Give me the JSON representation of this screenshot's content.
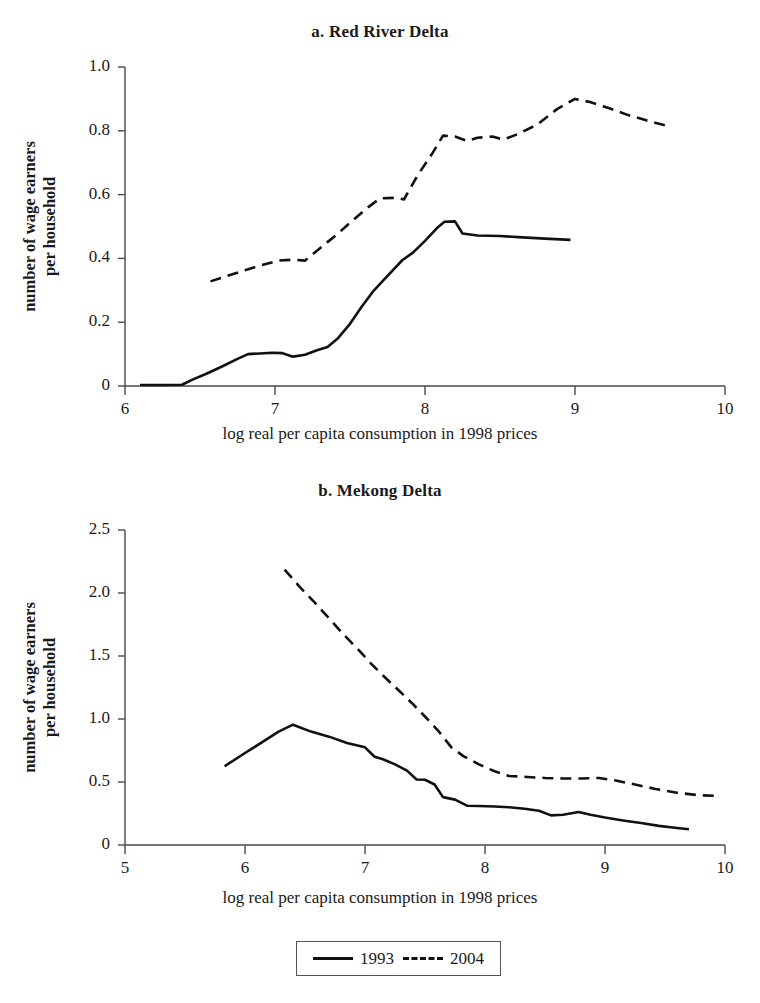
{
  "figure": {
    "legend": {
      "entries": [
        {
          "label": "1993",
          "style": "solid"
        },
        {
          "label": "2004",
          "style": "dashed"
        }
      ]
    }
  },
  "chart_data": [
    {
      "id": "panel-a",
      "type": "line",
      "title": "a. Red River Delta",
      "xlabel": "log real per capita consumption in 1998 prices",
      "ylabel": "number of wage earners\nper household",
      "ylabel_line1": "number of wage earners",
      "ylabel_line2": "per household",
      "xlim": [
        6,
        10
      ],
      "ylim": [
        0,
        1.0
      ],
      "xticks": [
        6,
        7,
        8,
        9,
        10
      ],
      "xtick_labels": [
        "6",
        "7",
        "8",
        "9",
        "10"
      ],
      "yticks": [
        0,
        0.2,
        0.4,
        0.6,
        0.8,
        1.0
      ],
      "ytick_labels": [
        "0",
        "0.2",
        "0.4",
        "0.6",
        "0.8",
        "1.0"
      ],
      "grid": false,
      "legend_position": "below-figure",
      "series": [
        {
          "name": "1993",
          "style": "solid",
          "color": "#111111",
          "points": [
            [
              6.1,
              0.003
            ],
            [
              6.2,
              0.003
            ],
            [
              6.3,
              0.003
            ],
            [
              6.38,
              0.004
            ],
            [
              6.45,
              0.02
            ],
            [
              6.55,
              0.04
            ],
            [
              6.65,
              0.062
            ],
            [
              6.75,
              0.085
            ],
            [
              6.82,
              0.1
            ],
            [
              6.9,
              0.102
            ],
            [
              6.98,
              0.104
            ],
            [
              7.05,
              0.103
            ],
            [
              7.12,
              0.092
            ],
            [
              7.2,
              0.098
            ],
            [
              7.28,
              0.112
            ],
            [
              7.35,
              0.122
            ],
            [
              7.42,
              0.15
            ],
            [
              7.5,
              0.195
            ],
            [
              7.58,
              0.25
            ],
            [
              7.66,
              0.3
            ],
            [
              7.75,
              0.345
            ],
            [
              7.85,
              0.395
            ],
            [
              7.92,
              0.418
            ],
            [
              8.0,
              0.455
            ],
            [
              8.08,
              0.495
            ],
            [
              8.13,
              0.515
            ],
            [
              8.2,
              0.516
            ],
            [
              8.25,
              0.478
            ],
            [
              8.35,
              0.472
            ],
            [
              8.5,
              0.47
            ],
            [
              8.65,
              0.466
            ],
            [
              8.8,
              0.462
            ],
            [
              8.97,
              0.458
            ]
          ]
        },
        {
          "name": "2004",
          "style": "dashed",
          "color": "#111111",
          "points": [
            [
              6.57,
              0.328
            ],
            [
              6.7,
              0.348
            ],
            [
              6.8,
              0.363
            ],
            [
              6.92,
              0.38
            ],
            [
              7.02,
              0.393
            ],
            [
              7.12,
              0.396
            ],
            [
              7.2,
              0.393
            ],
            [
              7.3,
              0.432
            ],
            [
              7.42,
              0.478
            ],
            [
              7.52,
              0.52
            ],
            [
              7.62,
              0.56
            ],
            [
              7.7,
              0.588
            ],
            [
              7.8,
              0.59
            ],
            [
              7.86,
              0.585
            ],
            [
              7.95,
              0.66
            ],
            [
              8.05,
              0.73
            ],
            [
              8.12,
              0.785
            ],
            [
              8.2,
              0.782
            ],
            [
              8.28,
              0.768
            ],
            [
              8.35,
              0.778
            ],
            [
              8.45,
              0.782
            ],
            [
              8.52,
              0.772
            ],
            [
              8.62,
              0.79
            ],
            [
              8.75,
              0.82
            ],
            [
              8.88,
              0.868
            ],
            [
              9.0,
              0.9
            ],
            [
              9.1,
              0.89
            ],
            [
              9.22,
              0.872
            ],
            [
              9.35,
              0.85
            ],
            [
              9.48,
              0.832
            ],
            [
              9.62,
              0.815
            ]
          ]
        }
      ]
    },
    {
      "id": "panel-b",
      "type": "line",
      "title": "b. Mekong Delta",
      "xlabel": "log real per capita consumption in 1998 prices",
      "ylabel": "number of wage earners\nper household",
      "ylabel_line1": "number of wage earners",
      "ylabel_line2": "per household",
      "xlim": [
        5,
        10
      ],
      "ylim": [
        0,
        2.5
      ],
      "xticks": [
        5,
        6,
        7,
        8,
        9,
        10
      ],
      "xtick_labels": [
        "5",
        "6",
        "7",
        "8",
        "9",
        "10"
      ],
      "yticks": [
        0,
        0.5,
        1.0,
        1.5,
        2.0,
        2.5
      ],
      "ytick_labels": [
        "0",
        "0.5",
        "1.0",
        "1.5",
        "2.0",
        "2.5"
      ],
      "grid": false,
      "legend_position": "below-figure",
      "series": [
        {
          "name": "1993",
          "style": "solid",
          "color": "#111111",
          "points": [
            [
              5.83,
              0.625
            ],
            [
              6.0,
              0.73
            ],
            [
              6.15,
              0.82
            ],
            [
              6.28,
              0.9
            ],
            [
              6.4,
              0.955
            ],
            [
              6.55,
              0.9
            ],
            [
              6.7,
              0.86
            ],
            [
              6.85,
              0.81
            ],
            [
              7.0,
              0.775
            ],
            [
              7.08,
              0.7
            ],
            [
              7.15,
              0.68
            ],
            [
              7.25,
              0.64
            ],
            [
              7.35,
              0.59
            ],
            [
              7.43,
              0.52
            ],
            [
              7.5,
              0.518
            ],
            [
              7.58,
              0.48
            ],
            [
              7.65,
              0.38
            ],
            [
              7.75,
              0.36
            ],
            [
              7.85,
              0.312
            ],
            [
              7.95,
              0.31
            ],
            [
              8.08,
              0.305
            ],
            [
              8.2,
              0.3
            ],
            [
              8.33,
              0.288
            ],
            [
              8.45,
              0.272
            ],
            [
              8.55,
              0.235
            ],
            [
              8.65,
              0.24
            ],
            [
              8.78,
              0.262
            ],
            [
              8.88,
              0.24
            ],
            [
              9.0,
              0.218
            ],
            [
              9.15,
              0.195
            ],
            [
              9.3,
              0.175
            ],
            [
              9.45,
              0.152
            ],
            [
              9.6,
              0.135
            ],
            [
              9.7,
              0.125
            ]
          ]
        },
        {
          "name": "2004",
          "style": "dashed",
          "color": "#111111",
          "points": [
            [
              6.33,
              2.185
            ],
            [
              6.45,
              2.055
            ],
            [
              6.58,
              1.925
            ],
            [
              6.7,
              1.8
            ],
            [
              6.82,
              1.672
            ],
            [
              6.95,
              1.545
            ],
            [
              7.05,
              1.44
            ],
            [
              7.15,
              1.345
            ],
            [
              7.28,
              1.228
            ],
            [
              7.4,
              1.118
            ],
            [
              7.52,
              1.0
            ],
            [
              7.62,
              0.895
            ],
            [
              7.72,
              0.775
            ],
            [
              7.82,
              0.705
            ],
            [
              7.95,
              0.64
            ],
            [
              8.08,
              0.585
            ],
            [
              8.2,
              0.548
            ],
            [
              8.35,
              0.54
            ],
            [
              8.5,
              0.532
            ],
            [
              8.65,
              0.528
            ],
            [
              8.8,
              0.528
            ],
            [
              8.95,
              0.532
            ],
            [
              9.1,
              0.51
            ],
            [
              9.25,
              0.48
            ],
            [
              9.42,
              0.445
            ],
            [
              9.6,
              0.415
            ],
            [
              9.78,
              0.395
            ],
            [
              9.92,
              0.39
            ]
          ]
        }
      ]
    }
  ]
}
